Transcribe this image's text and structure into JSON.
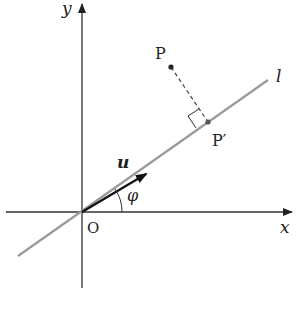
{
  "diagram": {
    "type": "vector-projection",
    "labels": {
      "y_axis": "y",
      "x_axis": "x",
      "origin": "O",
      "point": "P",
      "projection": "P′",
      "line": "l",
      "vector": "u",
      "angle": "φ"
    },
    "colors": {
      "axis": "#333333",
      "line_l": "#9a9a9a",
      "vector": "#1a1a1a",
      "dashed": "#444444",
      "text": "#222222"
    }
  }
}
